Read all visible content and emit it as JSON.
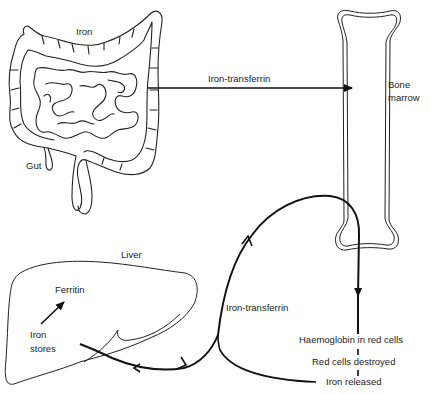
{
  "diagram": {
    "type": "iron-metabolism-cycle",
    "labels": {
      "gut_iron": "Iron",
      "gut": "Gut",
      "transport_top": "Iron-transferrin",
      "bone_marrow_line1": "Bone",
      "bone_marrow_line2": "marrow",
      "liver": "Liver",
      "ferritin": "Ferritin",
      "iron_stores_line1": "Iron",
      "iron_stores_line2": "stores",
      "transport_bottom": "Iron-transferrin",
      "haemoglobin": "Haemoglobin in red cells",
      "red_cells_destroyed": "Red cells destroyed",
      "iron_released": "Iron released"
    },
    "nodes": [
      {
        "id": "gut",
        "label": "Gut"
      },
      {
        "id": "bone_marrow",
        "label": "Bone marrow"
      },
      {
        "id": "liver",
        "label": "Liver"
      },
      {
        "id": "haemoglobin",
        "label": "Haemoglobin in red cells"
      },
      {
        "id": "red_cells_destroyed",
        "label": "Red cells destroyed"
      },
      {
        "id": "iron_released",
        "label": "Iron released"
      }
    ],
    "edges": [
      {
        "from": "gut",
        "to": "bone_marrow",
        "label": "Iron-transferrin"
      },
      {
        "from": "bone_marrow",
        "to": "haemoglobin"
      },
      {
        "from": "haemoglobin",
        "to": "red_cells_destroyed",
        "style": "dashed"
      },
      {
        "from": "red_cells_destroyed",
        "to": "iron_released",
        "style": "dashed"
      },
      {
        "from": "iron_released",
        "to": "liver",
        "label": "Iron-transferrin",
        "bidirectional": true
      },
      {
        "from": "liver",
        "to": "bone_marrow",
        "label": "Iron-transferrin"
      },
      {
        "from": "iron_stores",
        "to": "ferritin"
      }
    ],
    "colors": {
      "line": "#111111",
      "outline": "#222222",
      "background": "#ffffff"
    }
  }
}
